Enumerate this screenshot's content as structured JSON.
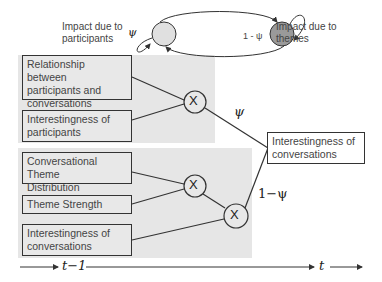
{
  "top_legend": {
    "left_label_line1": "Impact due to",
    "left_label_line2": "participants",
    "right_label_line1": "Impact due to",
    "right_label_line2": "themes",
    "left_self_loop": "ψ",
    "right_self_loop": "1 - ψ"
  },
  "upper_group": {
    "boxes": [
      {
        "line1": "Relationship between",
        "line2": "participants and",
        "line3": "conversations"
      },
      {
        "line1": "Interestingness of",
        "line2": "participants"
      }
    ],
    "multiplier": "X"
  },
  "lower_group": {
    "boxes": [
      {
        "line1": "Conversational Theme",
        "line2": "Distribution"
      },
      {
        "line1": "Theme Strength"
      },
      {
        "line1": "Interestingness of",
        "line2": "conversations"
      }
    ],
    "multiplier1": "X",
    "multiplier2": "X"
  },
  "output": {
    "line1": "Interestingness of",
    "line2": "conversations",
    "upper_weight": "ψ",
    "lower_weight": "1−ψ"
  },
  "timeline": {
    "prev": "t−1",
    "curr": "t"
  },
  "colors": {
    "participant_node": "#e0e0e0",
    "theme_node": "#9a9a9a",
    "region_bg": "#e6e6e6"
  }
}
